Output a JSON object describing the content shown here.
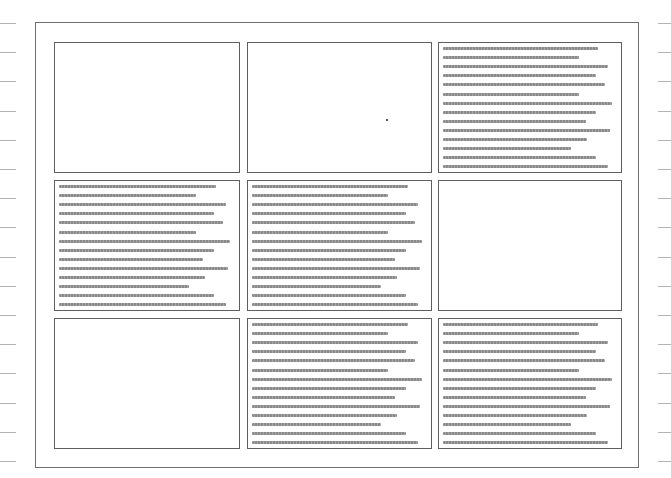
{
  "page": {
    "background": "#ffffff",
    "frame_color": "#6f6f6f",
    "panel_border_color": "#5e5e5e",
    "text_line_color": "#8a8a8a"
  },
  "margin_ticks": {
    "count": 16,
    "first_y": 23,
    "spacing": 29.2
  },
  "grid": {
    "columns": [
      54,
      247,
      438
    ],
    "column_widths": [
      186,
      185,
      184
    ],
    "rows": [
      42,
      180,
      318
    ],
    "row_height": 131,
    "panels": [
      {
        "id": 1,
        "type": "blank"
      },
      {
        "id": 2,
        "type": "blank",
        "mark": {
          "x": 138,
          "y": 76
        }
      },
      {
        "id": 3,
        "type": "text"
      },
      {
        "id": 4,
        "type": "text"
      },
      {
        "id": 5,
        "type": "text"
      },
      {
        "id": 6,
        "type": "blank"
      },
      {
        "id": 7,
        "type": "blank"
      },
      {
        "id": 8,
        "type": "text"
      },
      {
        "id": 9,
        "type": "text"
      }
    ]
  },
  "text_block": {
    "line_count": 14,
    "first_line_offset": 4,
    "line_spacing": 9.1,
    "line_length_fractions": [
      0.88,
      0.77,
      0.94,
      0.87,
      0.92,
      0.77,
      0.96,
      0.87,
      0.81,
      0.95,
      0.82,
      0.73,
      0.87,
      0.94
    ],
    "content": "illegible placeholder text lines"
  }
}
